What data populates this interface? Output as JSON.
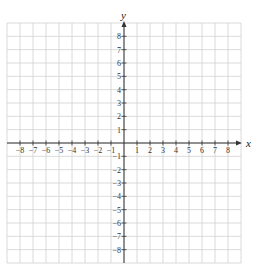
{
  "chart_data": {
    "type": "coordinate-grid",
    "title": "",
    "xlabel": "x",
    "ylabel": "y",
    "xlim": [
      -9,
      9
    ],
    "ylim": [
      -9,
      9
    ],
    "grid": true,
    "x_ticks": [
      -8,
      -7,
      -6,
      -5,
      -4,
      -3,
      -2,
      -1,
      1,
      2,
      3,
      4,
      5,
      6,
      7,
      8
    ],
    "y_ticks": [
      8,
      7,
      6,
      5,
      4,
      3,
      2,
      1,
      -1,
      -2,
      -3,
      -4,
      -5,
      -6,
      -7,
      -8
    ],
    "series": []
  },
  "colors": {
    "grid": "#d0d0d0",
    "axis": "#333333"
  }
}
